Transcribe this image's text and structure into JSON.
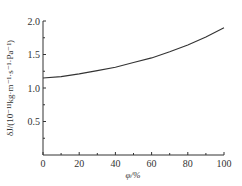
{
  "chart_data": {
    "type": "line",
    "title": "",
    "xlabel": "φ/%",
    "ylabel": "δJ/(10⁻¹¹kg·m⁻¹·s⁻¹·Pa⁻¹)",
    "xlim": [
      0,
      100
    ],
    "ylim": [
      0,
      2.0
    ],
    "xticks": [
      0,
      20,
      40,
      60,
      80,
      100
    ],
    "yticks": [
      0.5,
      1.0,
      1.5,
      2.0
    ],
    "xtick_labels": [
      "0",
      "20",
      "40",
      "60",
      "80",
      "100"
    ],
    "ytick_labels": [
      "0.5",
      "1.0",
      "1.5",
      "2.0"
    ],
    "grid": false,
    "legend": null,
    "series": [
      {
        "name": "δJ",
        "x": [
          0,
          10,
          20,
          30,
          40,
          50,
          60,
          70,
          80,
          90,
          100
        ],
        "values": [
          1.15,
          1.17,
          1.21,
          1.26,
          1.31,
          1.38,
          1.45,
          1.54,
          1.64,
          1.76,
          1.9
        ],
        "color": "#333333"
      }
    ]
  }
}
